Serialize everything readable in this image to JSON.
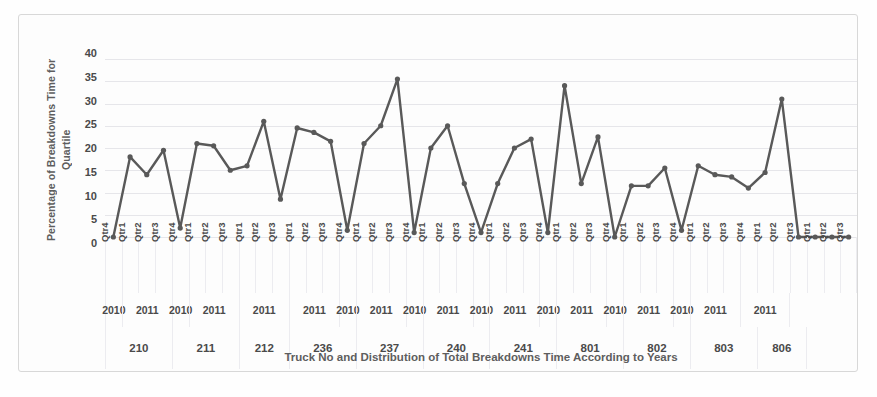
{
  "chart_data": {
    "type": "line",
    "title": "",
    "xlabel": "Truck No and Distribution of Total Breakdowns Time According to Years",
    "ylabel": "Percentage of Breakdowns Time for Quartile",
    "ylabel_lines": [
      "Percentage of Breakdowns Time for",
      "Quartile"
    ],
    "ylim": [
      0,
      40
    ],
    "yticks": [
      0,
      5,
      10,
      15,
      20,
      25,
      30,
      35,
      40
    ],
    "ytick_labels": [
      "0",
      "5",
      "10",
      "15",
      "20",
      "25",
      "30",
      "35",
      "40"
    ],
    "grid": true,
    "legend": "none",
    "series_color": "#595959",
    "marker": "circle",
    "categories": [
      "Qtr4",
      "Qtr1",
      "Qtr2",
      "Qtr3",
      "Qtr4",
      "Qtr1",
      "Qtr2",
      "Qtr3",
      "Qtr1",
      "Qtr2",
      "Qtr3",
      "Qtr1",
      "Qtr2",
      "Qtr3",
      "Qtr4",
      "Qtr1",
      "Qtr2",
      "Qtr3",
      "Qtr4",
      "Qtr1",
      "Qtr2",
      "Qtr3",
      "Qtr4",
      "Qtr1",
      "Qtr2",
      "Qtr3",
      "Qtr4",
      "Qtr1",
      "Qtr2",
      "Qtr3",
      "Qtr4",
      "Qtr1",
      "Qtr2",
      "Qtr3",
      "Qtr4",
      "Qtr1",
      "Qtr2",
      "Qtr3",
      "Qtr4",
      "Qtr1",
      "Qtr2",
      "Qtr3",
      "Qtr1",
      "Qtr2",
      "Qtr3"
    ],
    "values": [
      0,
      18,
      14,
      19.5,
      2,
      21,
      20.5,
      15,
      16,
      26,
      8.5,
      24.5,
      23.5,
      21.5,
      1.5,
      21,
      25,
      35.5,
      1,
      20,
      25,
      12,
      1,
      12,
      20,
      22,
      1,
      34,
      12,
      22.5,
      0,
      11.5,
      11.5,
      15.5,
      1.5,
      16,
      14,
      13.5,
      11,
      14.5,
      31,
      0,
      0,
      0,
      0
    ],
    "years": [
      {
        "label": "2010",
        "span": 1
      },
      {
        "label": "2011",
        "span": 3
      },
      {
        "label": "2010",
        "span": 1
      },
      {
        "label": "2011",
        "span": 3
      },
      {
        "label": "2011",
        "span": 3
      },
      {
        "label": "2011",
        "span": 3
      },
      {
        "label": "2010",
        "span": 1
      },
      {
        "label": "2011",
        "span": 3
      },
      {
        "label": "2010",
        "span": 1
      },
      {
        "label": "2011",
        "span": 3
      },
      {
        "label": "2010",
        "span": 1
      },
      {
        "label": "2011",
        "span": 3
      },
      {
        "label": "2010",
        "span": 1
      },
      {
        "label": "2011",
        "span": 3
      },
      {
        "label": "2010",
        "span": 1
      },
      {
        "label": "2011",
        "span": 3
      },
      {
        "label": "2010",
        "span": 1
      },
      {
        "label": "2011",
        "span": 3
      },
      {
        "label": "2011",
        "span": 3
      }
    ],
    "trucks": [
      {
        "label": "210",
        "span": 4
      },
      {
        "label": "211",
        "span": 4
      },
      {
        "label": "212",
        "span": 3
      },
      {
        "label": "236",
        "span": 4
      },
      {
        "label": "237",
        "span": 4
      },
      {
        "label": "240",
        "span": 4
      },
      {
        "label": "241",
        "span": 4
      },
      {
        "label": "801",
        "span": 4
      },
      {
        "label": "802",
        "span": 4
      },
      {
        "label": "803",
        "span": 4
      },
      {
        "label": "806",
        "span": 3
      }
    ]
  }
}
